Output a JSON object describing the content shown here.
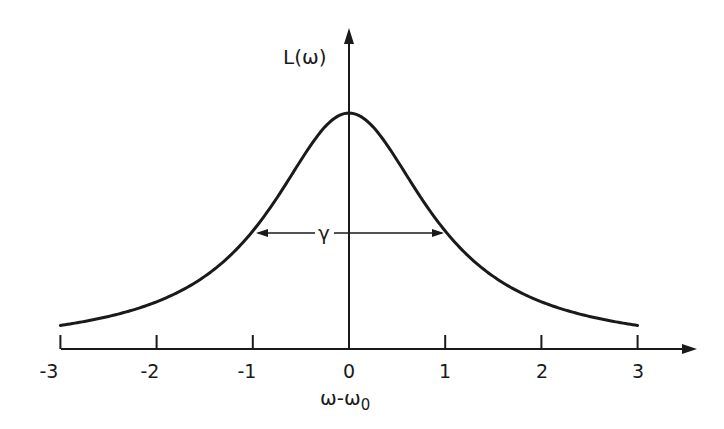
{
  "chart_data": {
    "type": "line",
    "title": "",
    "function": "Lorentzian L(ω) = 1 / (1 + (ω-ω0)^2)",
    "xlabel": "ω-ω0",
    "ylabel": "L(ω)",
    "xlim": [
      -3,
      3
    ],
    "xticks": [
      -3,
      -2,
      -1,
      0,
      1,
      2,
      3
    ],
    "xtick_labels": [
      "-3",
      "-2",
      "-1",
      "0",
      "1",
      "2",
      "3"
    ],
    "yticks": [],
    "grid": false,
    "legend": null,
    "series": [
      {
        "name": "L(ω)",
        "x": [
          -3,
          -2.5,
          -2,
          -1.5,
          -1,
          -0.5,
          0,
          0.5,
          1,
          1.5,
          2,
          2.5,
          3
        ],
        "values": [
          0.1,
          0.138,
          0.2,
          0.308,
          0.5,
          0.8,
          1.0,
          0.8,
          0.5,
          0.308,
          0.2,
          0.138,
          0.1
        ]
      }
    ],
    "annotations": [
      {
        "text": "γ",
        "type": "double-arrow",
        "x_from": -1,
        "x_to": 1,
        "y": 0.5,
        "meaning": "full width at half maximum"
      }
    ]
  },
  "labels": {
    "ylabel": "L(ω)",
    "xlabel": "ω-ω",
    "xlabel_sub": "0",
    "gamma": "γ",
    "ticks": [
      "-3",
      "-2",
      "-1",
      "0",
      "1",
      "2",
      "3"
    ]
  },
  "colors": {
    "ink": "#1a1a1a",
    "background": "#ffffff"
  }
}
